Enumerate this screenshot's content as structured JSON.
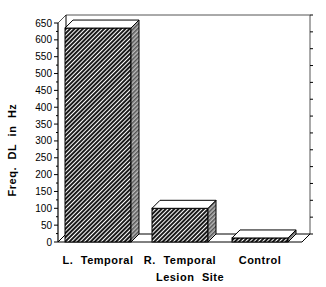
{
  "chart_data": {
    "type": "bar",
    "title": "",
    "xlabel": "Lesion Site",
    "ylabel": "Freq. DL in Hz",
    "categories": [
      "L. Temporal",
      "R. Temporal",
      "Control"
    ],
    "values": [
      635,
      100,
      12
    ],
    "ylim": [
      0,
      650
    ],
    "yticks": [
      0,
      50,
      100,
      150,
      200,
      250,
      300,
      350,
      400,
      450,
      500,
      550,
      600,
      650
    ],
    "style": "3d-bar-hatched",
    "grid": false,
    "legend": null
  },
  "colors": {
    "bar_fill": "#3a3a3a",
    "bar_side": "#888888",
    "bar_top": "#ffffff",
    "axis": "#000000"
  }
}
